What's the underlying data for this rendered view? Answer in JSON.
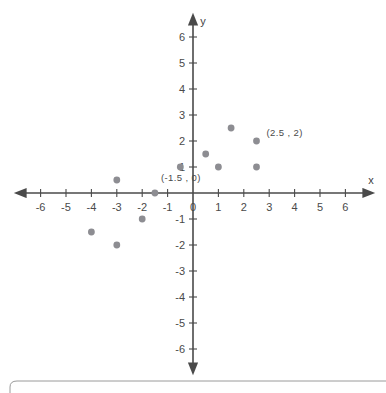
{
  "figure": {
    "background_color": "#ffffff",
    "axis_color": "#4a4a4a",
    "point_color": "#8d8d92",
    "label_color": "#4a4a4a",
    "frame_color": "#9a9a9a"
  },
  "chart_data": {
    "type": "scatter",
    "title": "",
    "xlabel": "x",
    "ylabel": "y",
    "xlim": [
      -6.5,
      6.5
    ],
    "ylim": [
      -6.5,
      6.5
    ],
    "grid": false,
    "legend": null,
    "x_ticks": [
      -6,
      -5,
      -4,
      -3,
      -2,
      -1,
      0,
      1,
      2,
      3,
      4,
      5,
      6
    ],
    "x_tick_labels": [
      "-6",
      "-5",
      "-4",
      "-3",
      "-2",
      "-1",
      "0",
      "1",
      "2",
      "3",
      "4",
      "5",
      "6"
    ],
    "y_ticks": [
      -6,
      -5,
      -4,
      -3,
      -2,
      -1,
      1,
      2,
      3,
      4,
      5,
      6
    ],
    "y_tick_labels": [
      "-6",
      "-5",
      "-4",
      "-3",
      "-2",
      "-1",
      "1",
      "2",
      "3",
      "4",
      "5",
      "6"
    ],
    "points": [
      {
        "x": -4,
        "y": -1.5,
        "label": ""
      },
      {
        "x": -3,
        "y": 0.5,
        "label": ""
      },
      {
        "x": -3,
        "y": -2,
        "label": ""
      },
      {
        "x": -2,
        "y": -1,
        "label": ""
      },
      {
        "x": -1.5,
        "y": 0,
        "label": "(-1.5 , 0)"
      },
      {
        "x": -0.5,
        "y": 1,
        "label": ""
      },
      {
        "x": 0.5,
        "y": 1.5,
        "label": ""
      },
      {
        "x": 1,
        "y": 1,
        "label": ""
      },
      {
        "x": 1.5,
        "y": 2.5,
        "label": ""
      },
      {
        "x": 2.5,
        "y": 2,
        "label": "(2.5 , 2)"
      },
      {
        "x": 2.5,
        "y": 1,
        "label": ""
      }
    ],
    "annotations": [
      {
        "text": "(-1.5 , 0)",
        "x": -1.5,
        "y": 0,
        "dx": 6,
        "dy": -12
      },
      {
        "text": "(2.5 , 2)",
        "x": 2.5,
        "y": 2,
        "dx": 10,
        "dy": -5
      }
    ]
  },
  "axes": {
    "x_axis_name": "x",
    "y_axis_name": "y"
  },
  "frame": {
    "present": true
  }
}
